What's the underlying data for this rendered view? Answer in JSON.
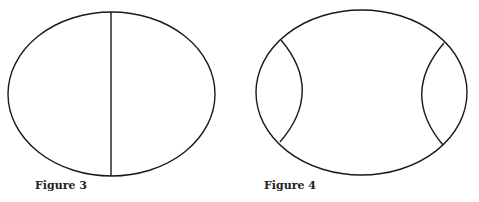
{
  "figures": [
    {
      "caption": "Figure 3",
      "description": "Ellipse divided by a vertical line into two halves"
    },
    {
      "caption": "Figure 4",
      "description": "Ellipse with two inward-bulging arcs cutting off left and right lens-shaped regions"
    }
  ],
  "colors": {
    "stroke": "#1a1a1a",
    "background": "#ffffff"
  }
}
